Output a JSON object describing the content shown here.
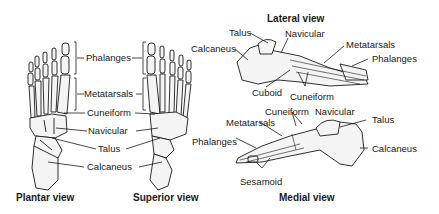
{
  "diagram": {
    "views": [
      {
        "id": "plantar",
        "title": "Plantar view",
        "labels": [
          "Phalanges",
          "Metatarsals",
          "Cuneiform",
          "Navicular",
          "Talus",
          "Calcaneus"
        ]
      },
      {
        "id": "superior",
        "title": "Superior view",
        "labels": []
      },
      {
        "id": "lateral",
        "title": "Lateral view",
        "labels": [
          "Talus",
          "Navicular",
          "Calcaneus",
          "Metatarsals",
          "Phalanges",
          "Cuboid",
          "Cuneiform"
        ]
      },
      {
        "id": "medial",
        "title": "Medial view",
        "labels": [
          "Cuneiform",
          "Navicular",
          "Metatarsals",
          "Talus",
          "Phalanges",
          "Calcaneus",
          "Sesamoid"
        ]
      }
    ],
    "colors": {
      "ink": "#1a1a1a",
      "bone_fill": "#f4f4f4",
      "background": "#ffffff"
    }
  }
}
